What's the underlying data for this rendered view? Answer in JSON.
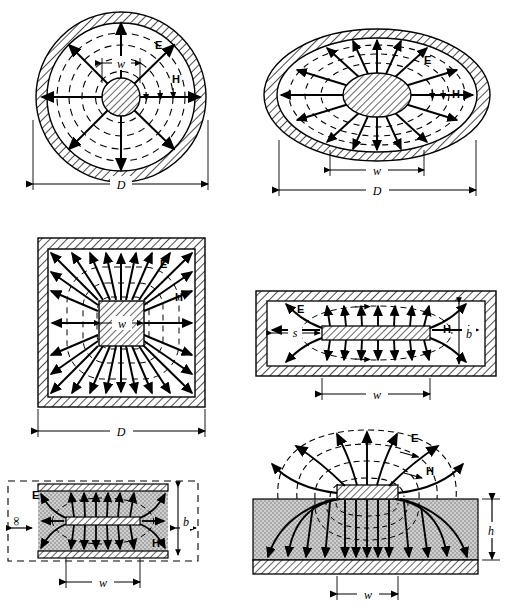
{
  "figure": {
    "field_labels": {
      "electric": "E",
      "magnetic": "H"
    },
    "colors": {
      "line": "#000000",
      "background": "#ffffff",
      "dielectric_fill": "#c8c8c8",
      "hatch": "#000000"
    }
  },
  "panels": [
    {
      "id": "coaxial-circular",
      "name": "Circular coaxial line",
      "labels": {
        "e_field": "E",
        "h_field": "H",
        "inner_dim": "w",
        "outer_dim": "D"
      },
      "e_lines": 8,
      "h_rings": 4,
      "shield_shape": "circle"
    },
    {
      "id": "coaxial-elliptical",
      "name": "Elliptical coaxial line",
      "labels": {
        "e_field": "E",
        "h_field": "H",
        "inner_dim": "w",
        "outer_dim": "D"
      },
      "e_lines": 16,
      "h_rings": 3,
      "shield_shape": "ellipse"
    },
    {
      "id": "coaxial-square",
      "name": "Square coaxial line",
      "labels": {
        "e_field": "E",
        "h_field": "H",
        "inner_dim": "w",
        "outer_dim": "D"
      },
      "e_lines": 28,
      "h_rings": 3,
      "shield_shape": "square"
    },
    {
      "id": "shielded-stripline",
      "name": "Shielded rectangular stripline",
      "labels": {
        "e_field": "E",
        "h_field": "H",
        "gap_dim": "s",
        "height_dim": "b",
        "width_dim": "w"
      },
      "shield_shape": "rectangle"
    },
    {
      "id": "stripline-infinite",
      "name": "Stripline with infinite ground planes",
      "labels": {
        "e_field": "E",
        "h_field": "H",
        "height_dim": "b",
        "width_dim": "w",
        "infinity_left": "∞",
        "infinity_right": "∞"
      },
      "shield_shape": "parallel-plates"
    },
    {
      "id": "microstrip",
      "name": "Microstrip line",
      "labels": {
        "e_field": "E",
        "h_field": "H",
        "substrate_height": "h",
        "width_dim": "w"
      },
      "shield_shape": "open"
    }
  ]
}
